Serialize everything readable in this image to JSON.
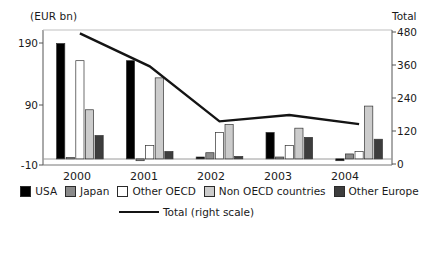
{
  "axis": {
    "unit_label": "(EUR bn)",
    "right_axis_title": "Total",
    "left_ticks": [
      "190",
      "90",
      "-10"
    ],
    "right_ticks": [
      "480",
      "360",
      "240",
      "120",
      "0"
    ]
  },
  "legend": {
    "items": [
      {
        "label": "USA",
        "color": "#000000",
        "swatch_name": "legend-swatch-usa"
      },
      {
        "label": "Japan",
        "color": "#8a8a8a",
        "swatch_name": "legend-swatch-japan"
      },
      {
        "label": "Other OECD",
        "color": "#ffffff",
        "swatch_name": "legend-swatch-other-oecd"
      },
      {
        "label": "Non OECD countries",
        "color": "#cccccc",
        "swatch_name": "legend-swatch-non-oecd"
      },
      {
        "label": "Other Europe",
        "color": "#3d3d3d",
        "swatch_name": "legend-swatch-other-europe"
      }
    ],
    "line_label": "Total (right scale)",
    "line_color": "#141414"
  },
  "chart_data": {
    "type": "bar",
    "title": "",
    "xlabel": "",
    "ylabel": "(EUR bn)",
    "y2label": "Total",
    "ylim": [
      -10,
      210
    ],
    "y2lim": [
      0,
      480
    ],
    "yticks": [
      -10,
      90,
      190
    ],
    "y2ticks": [
      0,
      120,
      240,
      360,
      480
    ],
    "grid": false,
    "legend_position": "bottom",
    "categories": [
      "2000",
      "2001",
      "2002",
      "2003",
      "2004"
    ],
    "series": [
      {
        "name": "USA",
        "color": "#000000",
        "values": [
          188,
          160,
          3,
          43,
          -3
        ]
      },
      {
        "name": "Japan",
        "color": "#8a8a8a",
        "values": [
          2,
          -3,
          10,
          3,
          8
        ]
      },
      {
        "name": "Other OECD",
        "color": "#ffffff",
        "values": [
          160,
          22,
          43,
          22,
          12
        ]
      },
      {
        "name": "Non OECD countries",
        "color": "#cccccc",
        "values": [
          80,
          132,
          56,
          50,
          86
        ]
      },
      {
        "name": "Other Europe",
        "color": "#3d3d3d",
        "values": [
          38,
          12,
          4,
          35,
          32
        ]
      }
    ],
    "line_series": {
      "name": "Total (right scale)",
      "axis": "right",
      "color": "#141414",
      "x": [
        "2000",
        "2001",
        "2002",
        "2003",
        "2004"
      ],
      "values": [
        475,
        355,
        155,
        178,
        145
      ]
    }
  }
}
